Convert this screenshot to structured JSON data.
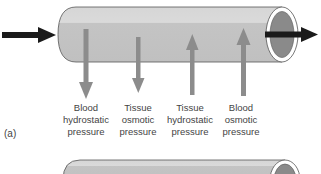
{
  "figure": {
    "panel_label": "(a)",
    "colors": {
      "tube_fill": "#c8c8c8",
      "tube_highlight": "#dcdcdc",
      "tube_outline": "#555555",
      "lumen_fill": "#8a8a8a",
      "flow_arrow": "#1a1a1a",
      "pressure_arrow": "#8c8c8c",
      "text": "#444444"
    },
    "flow": {
      "inflow_arrow": "blood-flow-in",
      "outflow_arrow": "blood-flow-out"
    },
    "pressures": [
      {
        "id": "blood-hydrostatic",
        "direction": "out",
        "lines": [
          "Blood",
          "hydrostatic",
          "pressure"
        ]
      },
      {
        "id": "tissue-osmotic",
        "direction": "out",
        "lines": [
          "Tissue",
          "osmotic",
          "pressure"
        ]
      },
      {
        "id": "tissue-hydrostatic",
        "direction": "in",
        "lines": [
          "Tissue",
          "hydrostatic",
          "pressure"
        ]
      },
      {
        "id": "blood-osmotic",
        "direction": "in",
        "lines": [
          "Blood",
          "osmotic",
          "pressure"
        ]
      }
    ]
  }
}
